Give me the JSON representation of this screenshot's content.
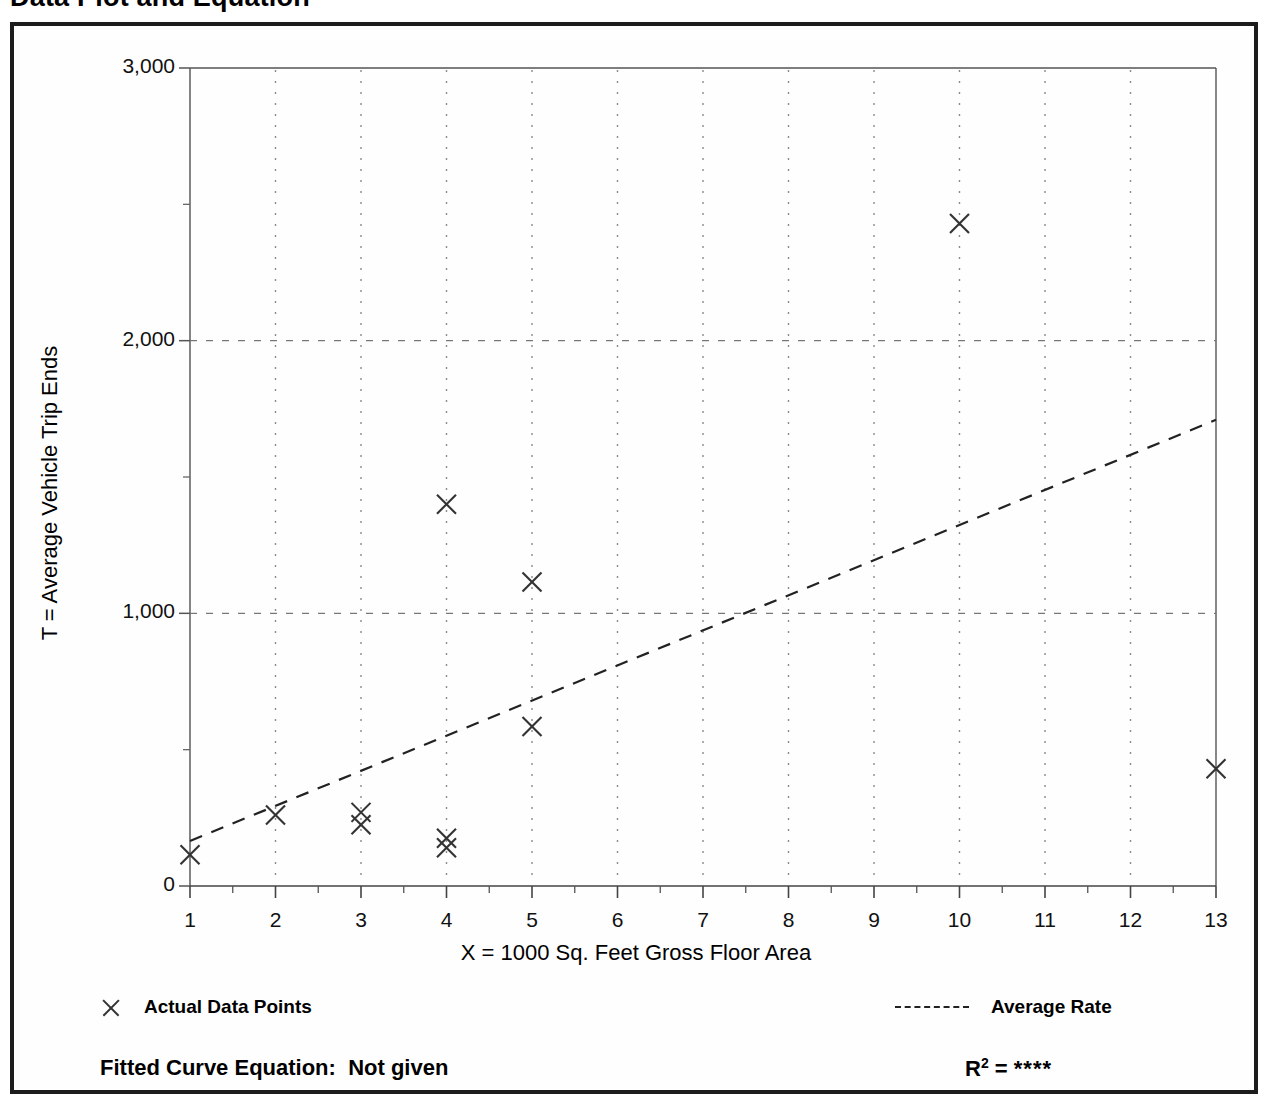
{
  "page": {
    "title": "Data Plot and Equation"
  },
  "chart_data": {
    "type": "scatter",
    "title": "Data Plot and Equation",
    "xlabel": "X = 1000 Sq. Feet Gross Floor Area",
    "ylabel": "T = Average Vehicle Trip Ends",
    "xlim": [
      1,
      13
    ],
    "ylim": [
      0,
      3000
    ],
    "xticks": [
      "1",
      "2",
      "3",
      "4",
      "5",
      "6",
      "7",
      "8",
      "9",
      "10",
      "11",
      "12",
      "13"
    ],
    "yticks": [
      "0",
      "1,000",
      "2,000",
      "3,000"
    ],
    "grid": "dotted vertical gridlines at each integer X; dashed horizontal gridlines at 1,000 and 2,000",
    "legend_position": "below plot",
    "series": [
      {
        "name": "Actual Data Points",
        "marker": "x",
        "points": [
          {
            "x": 1,
            "y": 115
          },
          {
            "x": 2,
            "y": 260
          },
          {
            "x": 3,
            "y": 270
          },
          {
            "x": 3,
            "y": 225
          },
          {
            "x": 4,
            "y": 1400
          },
          {
            "x": 4,
            "y": 175
          },
          {
            "x": 4,
            "y": 140
          },
          {
            "x": 5,
            "y": 1115
          },
          {
            "x": 5,
            "y": 585
          },
          {
            "x": 10,
            "y": 2430
          },
          {
            "x": 13,
            "y": 430
          }
        ]
      },
      {
        "name": "Average Rate",
        "style": "dashed-line",
        "points": [
          {
            "x": 1,
            "y": 165
          },
          {
            "x": 13,
            "y": 1710
          }
        ]
      }
    ]
  },
  "legend": {
    "data_points_label": "Actual Data Points",
    "average_rate_label": "Average Rate"
  },
  "footer": {
    "equation_label": "Fitted Curve Equation:",
    "equation_value": "Not given",
    "r2_label": "R",
    "r2_exponent": "2",
    "r2_equals": "=",
    "r2_value": "****"
  },
  "colors": {
    "frame": "#1c1c1c",
    "axis": "#555555",
    "marker": "#333333",
    "trend": "#222222",
    "grid": "#777777",
    "background": "#ffffff"
  }
}
